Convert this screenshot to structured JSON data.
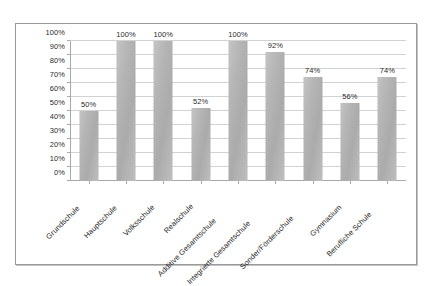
{
  "chart_data": {
    "type": "bar",
    "title": "",
    "subtitle": "",
    "xlabel": "",
    "ylabel": "",
    "ylim": [
      0,
      100
    ],
    "grid": true,
    "legend": false,
    "value_suffix": "%",
    "categories": [
      "Grundschule",
      "Hauptschule",
      "Volksschule",
      "Realschule",
      "Additive Gesamtschule",
      "Integrierte Gesamtschule",
      "Sonder/Förderschule",
      "Gymnasium",
      "Berufliche Schule"
    ],
    "values": [
      50,
      100,
      100,
      52,
      100,
      92,
      74,
      56,
      74
    ],
    "value_labels": [
      "50%",
      "100%",
      "100%",
      "52%",
      "100%",
      "92%",
      "74%",
      "56%",
      "74%"
    ],
    "ytick_labels": [
      "100%",
      "90%",
      "80%",
      "70%",
      "60%",
      "50%",
      "40%",
      "30%",
      "20%",
      "10%",
      "0%"
    ],
    "ytick_values": [
      100,
      90,
      80,
      70,
      60,
      50,
      40,
      30,
      20,
      10,
      0
    ],
    "colors": {
      "bar": "#b4b4b4",
      "gridline": "#d2d2d2",
      "axis": "#a8a8a8",
      "text": "#2b2b2b",
      "border": "#9a9a9a",
      "background": "#ffffff"
    }
  }
}
